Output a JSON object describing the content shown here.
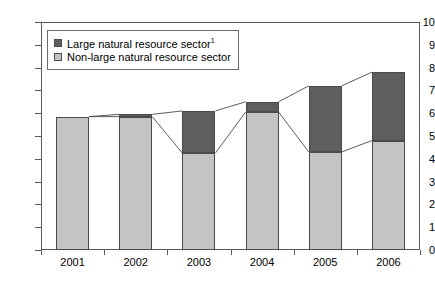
{
  "chart_data": {
    "type": "bar",
    "title": "",
    "subtitle": "",
    "xlabel": "",
    "ylabel": "",
    "stacked": true,
    "grid": false,
    "legend_position": "top-left",
    "categories": [
      "2001",
      "2002",
      "2003",
      "2004",
      "2005",
      "2006"
    ],
    "ylim": [
      0,
      10
    ],
    "yticks": [
      0,
      1,
      2,
      3,
      4,
      5,
      6,
      7,
      8,
      9,
      10
    ],
    "ytick_labels": [
      "0",
      "1",
      "2",
      "3",
      "4",
      "5",
      "6",
      "7",
      "8",
      "9",
      "10"
    ],
    "series": [
      {
        "name": "Non-large natural resource sector",
        "color": "#c4c4c4",
        "values": [
          5.85,
          5.85,
          4.25,
          6.05,
          4.3,
          4.8
        ]
      },
      {
        "name": "Large natural resource sector",
        "color": "#5e5e5e",
        "values": [
          0.0,
          0.1,
          1.85,
          0.45,
          2.9,
          3.0
        ]
      }
    ],
    "totals": [
      5.85,
      5.95,
      6.1,
      6.5,
      7.2,
      7.8
    ],
    "connector_lines": [
      {
        "name": "total-connector",
        "points": [
          [
            0,
            5.85
          ],
          [
            1,
            5.95
          ],
          [
            2,
            6.1
          ],
          [
            3,
            6.5
          ],
          [
            4,
            7.2
          ],
          [
            5,
            7.8
          ]
        ]
      },
      {
        "name": "base-connector",
        "points": [
          [
            0,
            5.85
          ],
          [
            1,
            5.85
          ],
          [
            2,
            4.25
          ],
          [
            3,
            6.05
          ],
          [
            4,
            4.3
          ],
          [
            5,
            4.8
          ]
        ]
      }
    ]
  },
  "legend": {
    "items": [
      {
        "label": "Large natural resource sector",
        "footnote": "1",
        "swatch": "dark"
      },
      {
        "label": "Non-large natural resource sector",
        "footnote": "",
        "swatch": "light"
      }
    ]
  },
  "colors": {
    "large_sector": "#5e5e5e",
    "non_large_sector": "#c4c4c4",
    "axis": "#5a5a5a",
    "background": "#ffffff"
  }
}
